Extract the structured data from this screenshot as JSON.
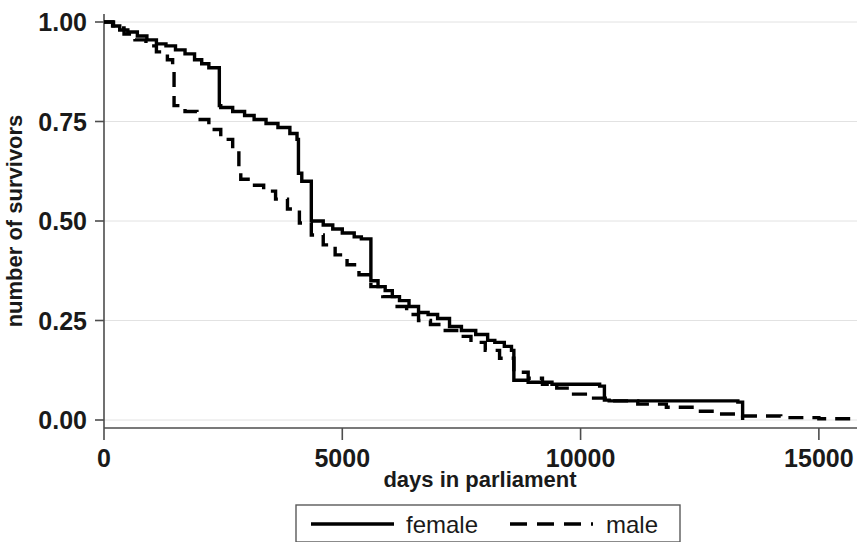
{
  "chart_data": {
    "type": "line",
    "title": "",
    "subtitle": "",
    "xlabel": "days in parliament",
    "ylabel": "number of survivors",
    "xlim": [
      0,
      15800
    ],
    "ylim": [
      0.0,
      1.0
    ],
    "xticks": [
      0,
      5000,
      10000,
      15000
    ],
    "xtick_labels": [
      "0",
      "5000",
      "10000",
      "15000"
    ],
    "yticks": [
      0.0,
      0.25,
      0.5,
      0.75,
      1.0
    ],
    "ytick_labels": [
      "0.00",
      "0.25",
      "0.50",
      "0.75",
      "1.00"
    ],
    "grid": true,
    "grid_axis": "y",
    "legend_position": "below-center",
    "step_type": "post",
    "series": [
      {
        "name": "female",
        "style": "solid",
        "color": "#000000",
        "x": [
          0,
          180,
          330,
          500,
          700,
          900,
          1100,
          1300,
          1500,
          1700,
          1900,
          2050,
          2200,
          2420,
          2450,
          2700,
          2950,
          3150,
          3400,
          3650,
          3900,
          4050,
          4080,
          4150,
          4350,
          4600,
          4800,
          5000,
          5250,
          5400,
          5600,
          5750,
          5900,
          6050,
          6200,
          6400,
          6600,
          6800,
          7000,
          7250,
          7500,
          7800,
          8050,
          8200,
          8400,
          8550,
          8600,
          8900,
          9400,
          10400,
          10500,
          10600,
          13300,
          13400
        ],
        "y": [
          1.0,
          0.99,
          0.98,
          0.975,
          0.965,
          0.955,
          0.945,
          0.94,
          0.93,
          0.92,
          0.905,
          0.895,
          0.885,
          0.79,
          0.785,
          0.775,
          0.765,
          0.755,
          0.745,
          0.735,
          0.72,
          0.705,
          0.62,
          0.6,
          0.5,
          0.49,
          0.48,
          0.47,
          0.46,
          0.455,
          0.35,
          0.335,
          0.325,
          0.31,
          0.3,
          0.285,
          0.27,
          0.265,
          0.255,
          0.235,
          0.225,
          0.215,
          0.2,
          0.195,
          0.185,
          0.175,
          0.1,
          0.095,
          0.09,
          0.085,
          0.05,
          0.048,
          0.045,
          0.0
        ]
      },
      {
        "name": "male",
        "style": "dashed",
        "color": "#000000",
        "x": [
          0,
          200,
          420,
          650,
          880,
          1100,
          1330,
          1440,
          1470,
          1700,
          1950,
          2200,
          2450,
          2700,
          2830,
          2870,
          3100,
          3350,
          3600,
          3850,
          4100,
          4350,
          4600,
          4850,
          5100,
          5350,
          5600,
          5850,
          6100,
          6350,
          6600,
          6850,
          7100,
          7400,
          7700,
          8000,
          8300,
          8600,
          8900,
          9200,
          9500,
          9800,
          10100,
          10600,
          11200,
          11800,
          12400,
          12800,
          13400,
          14200,
          15000,
          15800
        ],
        "y": [
          1.0,
          0.985,
          0.97,
          0.955,
          0.94,
          0.925,
          0.905,
          0.89,
          0.79,
          0.775,
          0.755,
          0.73,
          0.705,
          0.68,
          0.625,
          0.605,
          0.59,
          0.575,
          0.555,
          0.53,
          0.495,
          0.465,
          0.44,
          0.415,
          0.39,
          0.365,
          0.335,
          0.31,
          0.285,
          0.265,
          0.25,
          0.24,
          0.225,
          0.21,
          0.195,
          0.175,
          0.155,
          0.12,
          0.105,
          0.09,
          0.08,
          0.065,
          0.055,
          0.048,
          0.04,
          0.032,
          0.022,
          0.015,
          0.01,
          0.006,
          0.003,
          0.0
        ]
      }
    ]
  },
  "axes": {
    "y_title": "number of survivors",
    "x_title": "days in parliament",
    "x_tick_labels": [
      "0",
      "5000",
      "10000",
      "15000"
    ],
    "y_tick_labels": [
      "0.00",
      "0.25",
      "0.50",
      "0.75",
      "1.00"
    ]
  },
  "legend": {
    "items": [
      {
        "label": "female",
        "style": "solid"
      },
      {
        "label": "male",
        "style": "dashed"
      }
    ]
  }
}
